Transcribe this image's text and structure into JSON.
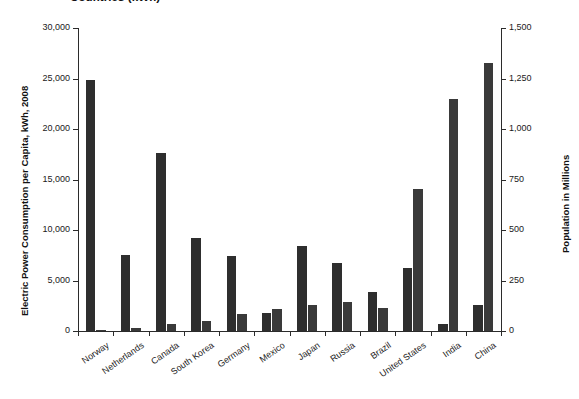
{
  "chart_data": {
    "type": "bar",
    "title": "Countries (kWh)",
    "title_note": "title is clipped by the top edge of the screenshot",
    "categories": [
      "Norway",
      "Netherlands",
      "Canada",
      "South Korea",
      "Germany",
      "Mexico",
      "Japan",
      "Russia",
      "Brazil",
      "United States",
      "India",
      "China"
    ],
    "series": [
      {
        "name": "Electric Power Consumption per Capita, kWh, 2008",
        "axis": "left",
        "color": "#2e2e2e",
        "values": [
          24900,
          7500,
          17600,
          9200,
          7400,
          1800,
          8400,
          6700,
          3900,
          6200,
          700,
          2600
        ]
      },
      {
        "name": "Population in Millions",
        "axis": "right",
        "color": "#3a3a3a",
        "values": [
          5,
          17,
          34,
          49,
          82,
          107,
          128,
          142,
          116,
          705,
          1150,
          1325
        ]
      }
    ],
    "left_axis": {
      "label": "Electric Power Consumption per Capita, kWh, 2008",
      "ticks": [
        "0",
        "5,000",
        "10,000",
        "15,000",
        "20,000",
        "25,000",
        "30,000"
      ],
      "tick_values": [
        0,
        5000,
        10000,
        15000,
        20000,
        25000,
        30000
      ],
      "min": 0,
      "max": 30000
    },
    "right_axis": {
      "label": "Population in Millions",
      "ticks": [
        "0",
        "250",
        "500",
        "750",
        "1,000",
        "1,250",
        "1,500"
      ],
      "tick_values": [
        0,
        250,
        500,
        750,
        1000,
        1250,
        1500
      ],
      "min": 0,
      "max": 1500
    },
    "xlabel": "",
    "grid": false,
    "legend": "none"
  }
}
